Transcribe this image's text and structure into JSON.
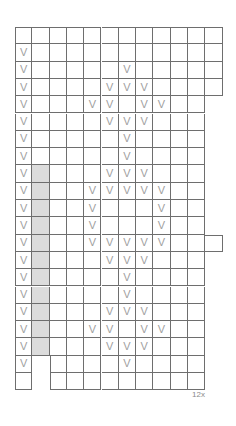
{
  "chart": {
    "kind": "knitting-stitch-chart",
    "title": "",
    "columns": 12,
    "rows": 21,
    "cell_width": 17.3,
    "cell_height": 17.3,
    "origin_x": 15,
    "origin_y": 27,
    "symbol": "V",
    "symbol_name": "v-stitch-symbol",
    "colors": {
      "grid_line": "#6e6e6e",
      "cell_background": "#ffffff",
      "shaded_column": "#dcdcdc",
      "symbol": "#a0a0a0",
      "label_text": "#8a8a8a"
    },
    "shaded_columns": [
      2
    ],
    "shaded_column_start_row": 9,
    "shaded_column_end_row": 21,
    "row_extents": [
      {
        "row": 1,
        "start_col": 1,
        "end_col": 12
      },
      {
        "row": 2,
        "start_col": 1,
        "end_col": 12
      },
      {
        "row": 3,
        "start_col": 1,
        "end_col": 12
      },
      {
        "row": 4,
        "start_col": 1,
        "end_col": 12
      },
      {
        "row": 5,
        "start_col": 1,
        "end_col": 11
      },
      {
        "row": 6,
        "start_col": 1,
        "end_col": 11
      },
      {
        "row": 7,
        "start_col": 1,
        "end_col": 11
      },
      {
        "row": 8,
        "start_col": 1,
        "end_col": 11
      },
      {
        "row": 9,
        "start_col": 1,
        "end_col": 11
      },
      {
        "row": 10,
        "start_col": 1,
        "end_col": 11
      },
      {
        "row": 11,
        "start_col": 1,
        "end_col": 11
      },
      {
        "row": 12,
        "start_col": 1,
        "end_col": 11
      },
      {
        "row": 13,
        "start_col": 1,
        "end_col": 12
      },
      {
        "row": 14,
        "start_col": 1,
        "end_col": 11
      },
      {
        "row": 15,
        "start_col": 1,
        "end_col": 11
      },
      {
        "row": 16,
        "start_col": 1,
        "end_col": 11
      },
      {
        "row": 17,
        "start_col": 1,
        "end_col": 11
      },
      {
        "row": 18,
        "start_col": 1,
        "end_col": 11
      },
      {
        "row": 19,
        "start_col": 1,
        "end_col": 11
      },
      {
        "row": 20,
        "start_col": 1,
        "end_col": 11
      },
      {
        "row": 21,
        "start_col": 1,
        "end_col": 11
      }
    ],
    "symbol_cells": [
      {
        "row": 1,
        "cols": []
      },
      {
        "row": 2,
        "cols": [
          1
        ]
      },
      {
        "row": 3,
        "cols": [
          1,
          7
        ]
      },
      {
        "row": 4,
        "cols": [
          1,
          6,
          7,
          8
        ]
      },
      {
        "row": 5,
        "cols": [
          1,
          5,
          6,
          8,
          9
        ]
      },
      {
        "row": 6,
        "cols": [
          1,
          6,
          7,
          8
        ]
      },
      {
        "row": 7,
        "cols": [
          1,
          7
        ]
      },
      {
        "row": 8,
        "cols": [
          1,
          7
        ]
      },
      {
        "row": 9,
        "cols": [
          1,
          6,
          7,
          8
        ]
      },
      {
        "row": 10,
        "cols": [
          1,
          5,
          6,
          7,
          8,
          9
        ]
      },
      {
        "row": 11,
        "cols": [
          1,
          5,
          9
        ]
      },
      {
        "row": 12,
        "cols": [
          1,
          5,
          9
        ]
      },
      {
        "row": 13,
        "cols": [
          1,
          5,
          6,
          7,
          8,
          9
        ]
      },
      {
        "row": 14,
        "cols": [
          1,
          6,
          7,
          8
        ]
      },
      {
        "row": 15,
        "cols": [
          1,
          7
        ]
      },
      {
        "row": 16,
        "cols": [
          1,
          7
        ]
      },
      {
        "row": 17,
        "cols": [
          1,
          6,
          7,
          8
        ]
      },
      {
        "row": 18,
        "cols": [
          1,
          5,
          6,
          8,
          9
        ]
      },
      {
        "row": 19,
        "cols": [
          1,
          6,
          7,
          8
        ]
      },
      {
        "row": 20,
        "cols": [
          1,
          7
        ]
      },
      {
        "row": 21,
        "cols": []
      }
    ],
    "left_step_rows": [
      {
        "row": 20,
        "empty_before_col": 3
      },
      {
        "row": 21,
        "empty_before_col": 3
      }
    ],
    "annotations": [
      {
        "name": "repeat-count-label",
        "text": "12x",
        "x": 192,
        "y": 390
      }
    ]
  }
}
